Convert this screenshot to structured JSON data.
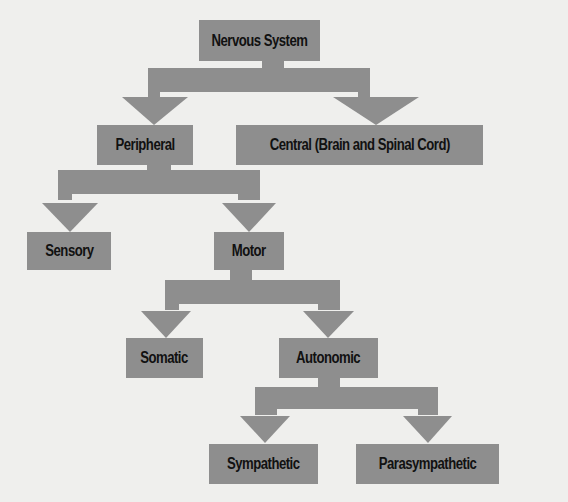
{
  "diagram": {
    "title": "Nervous System",
    "colors": {
      "box": "#8e8e8e",
      "connector": "#8e8e8e",
      "text": "#111111",
      "background": "#efefed"
    },
    "nodes": {
      "nervous_system": "Nervous System",
      "peripheral": "Peripheral",
      "central": "Central (Brain and Spinal Cord)",
      "sensory": "Sensory",
      "motor": "Motor",
      "somatic": "Somatic",
      "autonomic": "Autonomic",
      "sympathetic": "Sympathetic",
      "parasympathetic": "Parasympathetic"
    },
    "edges": [
      [
        "Nervous System",
        "Peripheral"
      ],
      [
        "Nervous System",
        "Central (Brain and Spinal Cord)"
      ],
      [
        "Peripheral",
        "Sensory"
      ],
      [
        "Peripheral",
        "Motor"
      ],
      [
        "Motor",
        "Somatic"
      ],
      [
        "Motor",
        "Autonomic"
      ],
      [
        "Autonomic",
        "Sympathetic"
      ],
      [
        "Autonomic",
        "Parasympathetic"
      ]
    ]
  }
}
